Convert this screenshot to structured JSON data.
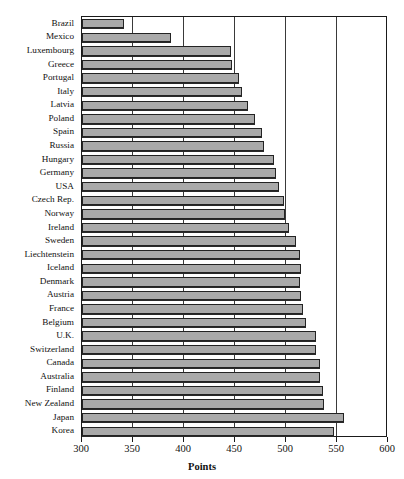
{
  "chart_data": {
    "type": "bar",
    "orientation": "horizontal",
    "title": "",
    "xlabel": "Points",
    "ylabel": "",
    "xlim": [
      300,
      600
    ],
    "xticks": [
      300,
      350,
      400,
      450,
      500,
      550,
      600
    ],
    "xticklabels": [
      "300",
      "350",
      "400",
      "450",
      "500",
      "550",
      "600"
    ],
    "grid": true,
    "grid_axis": "x",
    "legend": null,
    "bar_color": "#a9a9a9",
    "bar_edge_color": "#232323",
    "categories": [
      "Brazil",
      "Mexico",
      "Luxembourg",
      "Greece",
      "Portugal",
      "Italy",
      "Latvia",
      "Poland",
      "Spain",
      "Russia",
      "Hungary",
      "Germany",
      "USA",
      "Czech Rep.",
      "Norway",
      "Ireland",
      "Sweden",
      "Liechtenstein",
      "Iceland",
      "Denmark",
      "Austria",
      "France",
      "Belgium",
      "U.K.",
      "Switzerland",
      "Canada",
      "Australia",
      "Finland",
      "New Zealand",
      "Japan",
      "Korea"
    ],
    "values": [
      341,
      387,
      446,
      447,
      454,
      457,
      463,
      470,
      476,
      478,
      488,
      490,
      493,
      498,
      499,
      503,
      510,
      514,
      515,
      514,
      515,
      517,
      520,
      529,
      529,
      533,
      533,
      536,
      537,
      557,
      547
    ]
  },
  "axis": {
    "x_title": "Points"
  }
}
